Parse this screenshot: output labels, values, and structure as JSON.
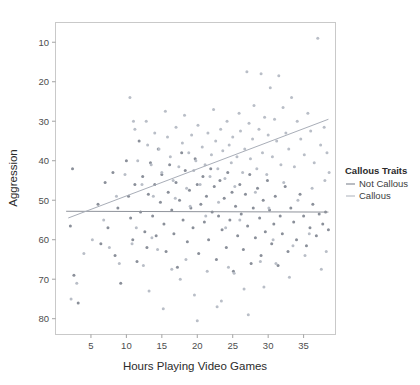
{
  "chart_data": {
    "type": "scatter",
    "title": "",
    "xlabel": "Hours Playing Video Games",
    "ylabel": "Aggression",
    "xlim": [
      0,
      39.5
    ],
    "ylim": [
      6,
      85
    ],
    "xticks": [
      5,
      10,
      15,
      20,
      25,
      30,
      35
    ],
    "yticks": [
      10,
      20,
      30,
      40,
      50,
      60,
      70,
      80
    ],
    "grid": false,
    "legend": {
      "title": "Callous Traits",
      "position": "right",
      "entries": [
        {
          "label": "Not Callous",
          "color": "#8a8f99",
          "marker": "line"
        },
        {
          "label": "Callous",
          "color": "#b9bec7",
          "marker": "line"
        }
      ]
    },
    "series": [
      {
        "name": "Not Callous",
        "color": "#8a8f99",
        "fit_line": {
          "x": [
            1.5,
            38.5
          ],
          "y": [
            37.2,
            37.0
          ],
          "color": "#8f939b"
        },
        "points": [
          [
            2.1,
            33.5
          ],
          [
            2.4,
            48.0
          ],
          [
            2.6,
            21.0
          ],
          [
            3.2,
            14.0
          ],
          [
            6.0,
            39.0
          ],
          [
            6.4,
            29.0
          ],
          [
            7.0,
            44.5
          ],
          [
            7.4,
            33.0
          ],
          [
            8.1,
            47.0
          ],
          [
            8.4,
            26.0
          ],
          [
            8.8,
            38.0
          ],
          [
            9.2,
            19.0
          ],
          [
            10.0,
            50.0
          ],
          [
            10.3,
            41.0
          ],
          [
            10.6,
            35.5
          ],
          [
            10.9,
            30.0
          ],
          [
            11.2,
            44.0
          ],
          [
            11.5,
            24.5
          ],
          [
            11.8,
            55.0
          ],
          [
            12.0,
            37.0
          ],
          [
            12.3,
            46.0
          ],
          [
            12.6,
            32.0
          ],
          [
            12.9,
            28.0
          ],
          [
            13.1,
            41.5
          ],
          [
            13.4,
            49.5
          ],
          [
            13.7,
            36.0
          ],
          [
            14.0,
            44.0
          ],
          [
            14.2,
            31.0
          ],
          [
            14.5,
            53.0
          ],
          [
            14.8,
            39.5
          ],
          [
            15.0,
            46.5
          ],
          [
            15.3,
            34.0
          ],
          [
            15.6,
            27.0
          ],
          [
            15.9,
            42.0
          ],
          [
            16.1,
            49.0
          ],
          [
            16.4,
            37.5
          ],
          [
            16.7,
            31.5
          ],
          [
            17.0,
            44.5
          ],
          [
            17.2,
            23.0
          ],
          [
            17.5,
            40.0
          ],
          [
            17.8,
            52.0
          ],
          [
            18.0,
            35.0
          ],
          [
            18.3,
            47.5
          ],
          [
            18.6,
            29.5
          ],
          [
            18.9,
            42.5
          ],
          [
            19.1,
            38.0
          ],
          [
            19.4,
            33.0
          ],
          [
            19.7,
            50.5
          ],
          [
            20.0,
            44.0
          ],
          [
            20.2,
            26.5
          ],
          [
            20.5,
            39.0
          ],
          [
            20.8,
            46.0
          ],
          [
            21.0,
            34.5
          ],
          [
            21.3,
            41.0
          ],
          [
            21.6,
            30.0
          ],
          [
            21.9,
            48.0
          ],
          [
            22.1,
            37.0
          ],
          [
            22.4,
            43.5
          ],
          [
            22.7,
            25.0
          ],
          [
            23.0,
            36.0
          ],
          [
            23.2,
            45.0
          ],
          [
            23.5,
            32.5
          ],
          [
            23.8,
            40.5
          ],
          [
            24.1,
            28.0
          ],
          [
            24.3,
            47.0
          ],
          [
            24.6,
            35.0
          ],
          [
            24.9,
            42.0
          ],
          [
            25.1,
            22.0
          ],
          [
            25.4,
            38.5
          ],
          [
            25.7,
            31.0
          ],
          [
            26.0,
            44.0
          ],
          [
            26.2,
            36.5
          ],
          [
            26.5,
            27.5
          ],
          [
            26.8,
            41.5
          ],
          [
            27.1,
            33.5
          ],
          [
            27.4,
            46.5
          ],
          [
            27.6,
            24.0
          ],
          [
            27.9,
            38.0
          ],
          [
            28.2,
            30.5
          ],
          [
            28.5,
            43.0
          ],
          [
            28.8,
            35.5
          ],
          [
            29.0,
            26.0
          ],
          [
            29.3,
            40.0
          ],
          [
            29.6,
            32.0
          ],
          [
            29.9,
            45.0
          ],
          [
            30.2,
            37.5
          ],
          [
            30.5,
            29.0
          ],
          [
            30.8,
            34.0
          ],
          [
            31.0,
            41.0
          ],
          [
            31.4,
            23.5
          ],
          [
            31.7,
            36.0
          ],
          [
            32.0,
            31.5
          ],
          [
            32.4,
            43.5
          ],
          [
            32.8,
            27.0
          ],
          [
            33.2,
            38.0
          ],
          [
            33.6,
            34.5
          ],
          [
            34.0,
            30.0
          ],
          [
            34.5,
            41.5
          ],
          [
            35.0,
            36.0
          ],
          [
            35.4,
            28.5
          ],
          [
            35.9,
            33.0
          ],
          [
            36.3,
            39.0
          ],
          [
            36.8,
            31.0
          ],
          [
            37.2,
            36.5
          ],
          [
            37.7,
            34.0
          ],
          [
            38.1,
            37.0
          ],
          [
            38.5,
            32.5
          ]
        ]
      },
      {
        "name": "Callous",
        "color": "#b9bec7",
        "fit_line": {
          "x": [
            1.8,
            38.5
          ],
          "y": [
            35.5,
            60.5
          ],
          "color": "#a9aeb8"
        },
        "points": [
          [
            10.5,
            66.0
          ],
          [
            11.0,
            60.0
          ],
          [
            11.2,
            58.0
          ],
          [
            11.6,
            50.0
          ],
          [
            12.8,
            60.0
          ],
          [
            13.0,
            54.0
          ],
          [
            13.5,
            49.0
          ],
          [
            14.0,
            57.0
          ],
          [
            14.6,
            53.0
          ],
          [
            15.0,
            47.0
          ],
          [
            15.5,
            62.5
          ],
          [
            15.8,
            56.0
          ],
          [
            16.2,
            51.0
          ],
          [
            16.6,
            45.0
          ],
          [
            17.0,
            58.5
          ],
          [
            17.4,
            48.5
          ],
          [
            17.9,
            54.5
          ],
          [
            18.2,
            61.5
          ],
          [
            18.5,
            43.0
          ],
          [
            18.8,
            52.0
          ],
          [
            19.2,
            56.5
          ],
          [
            19.5,
            47.5
          ],
          [
            19.8,
            50.0
          ],
          [
            20.1,
            59.0
          ],
          [
            20.4,
            44.0
          ],
          [
            20.7,
            53.5
          ],
          [
            21.1,
            49.0
          ],
          [
            21.5,
            57.0
          ],
          [
            21.8,
            46.0
          ],
          [
            22.0,
            51.5
          ],
          [
            22.3,
            63.0
          ],
          [
            22.6,
            55.0
          ],
          [
            22.9,
            48.0
          ],
          [
            23.3,
            58.0
          ],
          [
            23.6,
            52.5
          ],
          [
            23.9,
            45.5
          ],
          [
            24.2,
            60.0
          ],
          [
            24.5,
            54.0
          ],
          [
            24.8,
            49.5
          ],
          [
            25.0,
            56.0
          ],
          [
            25.3,
            43.5
          ],
          [
            25.6,
            51.0
          ],
          [
            25.9,
            62.0
          ],
          [
            26.1,
            57.5
          ],
          [
            26.4,
            47.0
          ],
          [
            26.7,
            53.0
          ],
          [
            27.0,
            72.5
          ],
          [
            27.3,
            59.5
          ],
          [
            27.5,
            50.5
          ],
          [
            27.8,
            55.5
          ],
          [
            28.0,
            64.0
          ],
          [
            28.4,
            48.0
          ],
          [
            28.7,
            58.0
          ],
          [
            29.0,
            72.0
          ],
          [
            29.2,
            52.0
          ],
          [
            29.5,
            61.0
          ],
          [
            29.8,
            46.5
          ],
          [
            30.0,
            56.5
          ],
          [
            30.3,
            68.5
          ],
          [
            30.6,
            51.0
          ],
          [
            30.9,
            60.5
          ],
          [
            31.2,
            55.0
          ],
          [
            31.5,
            71.5
          ],
          [
            31.8,
            49.0
          ],
          [
            32.1,
            63.5
          ],
          [
            32.5,
            57.0
          ],
          [
            32.9,
            53.0
          ],
          [
            33.3,
            66.0
          ],
          [
            33.7,
            48.5
          ],
          [
            34.1,
            60.0
          ],
          [
            34.6,
            55.5
          ],
          [
            35.1,
            51.5
          ],
          [
            35.6,
            62.0
          ],
          [
            36.0,
            57.5
          ],
          [
            36.5,
            49.5
          ],
          [
            37.0,
            81.0
          ],
          [
            37.4,
            54.0
          ],
          [
            37.9,
            58.5
          ],
          [
            38.3,
            52.0
          ],
          [
            38.6,
            47.0
          ],
          [
            12.2,
            44.0
          ],
          [
            13.8,
            41.0
          ],
          [
            16.9,
            40.5
          ],
          [
            19.0,
            38.5
          ],
          [
            21.2,
            36.0
          ],
          [
            23.0,
            39.5
          ],
          [
            24.0,
            33.0
          ],
          [
            26.0,
            35.0
          ],
          [
            28.2,
            42.0
          ],
          [
            30.1,
            38.0
          ],
          [
            32.2,
            44.5
          ],
          [
            34.2,
            40.0
          ],
          [
            36.2,
            43.0
          ],
          [
            38.0,
            45.0
          ],
          [
            9.8,
            46.5
          ],
          [
            8.6,
            41.0
          ],
          [
            6.8,
            35.0
          ],
          [
            5.2,
            30.0
          ],
          [
            4.0,
            26.5
          ],
          [
            3.0,
            19.0
          ],
          [
            2.2,
            15.0
          ],
          [
            13.2,
            17.0
          ],
          [
            15.2,
            12.5
          ],
          [
            17.6,
            20.0
          ],
          [
            19.6,
            16.0
          ],
          [
            21.4,
            22.0
          ],
          [
            23.4,
            14.5
          ],
          [
            25.2,
            21.5
          ],
          [
            27.2,
            11.0
          ],
          [
            29.4,
            18.0
          ],
          [
            31.1,
            24.0
          ],
          [
            33.0,
            20.5
          ],
          [
            35.2,
            26.0
          ],
          [
            37.5,
            22.5
          ],
          [
            20.0,
            9.5
          ],
          [
            22.8,
            13.0
          ],
          [
            24.4,
            23.0
          ],
          [
            26.6,
            17.5
          ],
          [
            18.4,
            25.0
          ],
          [
            16.4,
            22.5
          ],
          [
            14.4,
            27.5
          ],
          [
            12.4,
            23.5
          ],
          [
            10.8,
            29.0
          ],
          [
            9.0,
            24.0
          ],
          [
            7.6,
            28.0
          ],
          [
            11.4,
            33.0
          ],
          [
            13.6,
            30.5
          ],
          [
            28.9,
            24.5
          ],
          [
            30.7,
            30.0
          ],
          [
            33.5,
            28.5
          ],
          [
            35.8,
            31.5
          ],
          [
            38.2,
            27.0
          ]
        ]
      }
    ]
  },
  "axes": {
    "y_tick_labels": [
      "80",
      "70",
      "60",
      "50",
      "40",
      "30",
      "20",
      "10"
    ],
    "x_tick_labels": [
      "5",
      "10",
      "15",
      "20",
      "25",
      "30",
      "35"
    ]
  }
}
